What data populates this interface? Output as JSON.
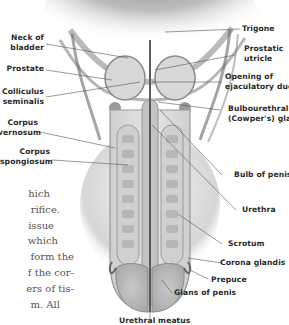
{
  "figure": {
    "type": "anatomical-illustration",
    "labels_left": [
      {
        "id": "neck-of-bladder",
        "lines": [
          "Neck of",
          "bladder"
        ]
      },
      {
        "id": "prostate",
        "lines": [
          "Prostate"
        ]
      },
      {
        "id": "colliculus-seminalis",
        "lines": [
          "Colliculus",
          "seminalis"
        ]
      },
      {
        "id": "corpus-cavernosum",
        "lines": [
          "Corpus",
          "cavernosum"
        ]
      },
      {
        "id": "corpus-spongiosum",
        "lines": [
          "Corpus",
          "spongiosum"
        ]
      }
    ],
    "labels_right": [
      {
        "id": "trigone",
        "lines": [
          "Trigone"
        ]
      },
      {
        "id": "prostatic-utricle",
        "lines": [
          "Prostatic",
          "utricle"
        ]
      },
      {
        "id": "opening-of-ejaculatory-duct",
        "lines": [
          "Opening of",
          "ejaculatory duct"
        ]
      },
      {
        "id": "bulbourethral-gland",
        "lines": [
          "Bulbourethral",
          "(Cowper's) gland"
        ]
      },
      {
        "id": "bulb-of-penis",
        "lines": [
          "Bulb of penis"
        ]
      },
      {
        "id": "urethra",
        "lines": [
          "Urethra"
        ]
      },
      {
        "id": "scrotum",
        "lines": [
          "Scrotum"
        ]
      },
      {
        "id": "corona-glandis",
        "lines": [
          "Corona glandis"
        ]
      },
      {
        "id": "prepuce",
        "lines": [
          "Prepuce"
        ]
      },
      {
        "id": "glans-of-penis",
        "lines": [
          "Glans of penis"
        ]
      }
    ],
    "labels_bottom": [
      {
        "id": "urethral-meatus",
        "lines": [
          "Urethral meatus"
        ]
      }
    ]
  },
  "body_text_fragments": [
    "hich",
    "rifice.",
    "issue",
    "which",
    "form the",
    "f the cor-",
    "ers of tis-",
    "m.  All"
  ],
  "colors": {
    "tissue_dark": "#6e6e6e",
    "tissue_mid": "#a8a8a8",
    "tissue_light": "#d9d9d9",
    "label_text": "#2a2a2a",
    "leader_line": "#555555",
    "body_text": "#555555"
  }
}
